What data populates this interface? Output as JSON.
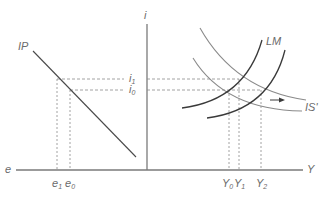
{
  "diagram": {
    "type": "IS-LM-IP diagram",
    "axes": {
      "vertical_label": "i",
      "horizontal_right_label": "Y",
      "horizontal_left_label": "e"
    },
    "curves": {
      "ip": {
        "label": "IP"
      },
      "lm": {
        "label": "LM"
      },
      "is": {
        "label": "IS'"
      }
    },
    "interest_levels": [
      {
        "base": "i",
        "sub": "1"
      },
      {
        "base": "i",
        "sub": "0"
      }
    ],
    "exchange_rates": [
      {
        "base": "e",
        "sub": "1"
      },
      {
        "base": "e",
        "sub": "0"
      }
    ],
    "outputs": [
      {
        "base": "Y",
        "sub": "0"
      },
      {
        "base": "Y",
        "sub": "1"
      },
      {
        "base": "Y",
        "sub": "2"
      }
    ],
    "colors": {
      "axis": "#7a7a7a",
      "lm_curve": "#3a3a3a",
      "is_curve": "#8a8a8a",
      "dashed": "#8a8a8a",
      "label": "#6b6b6b"
    }
  }
}
